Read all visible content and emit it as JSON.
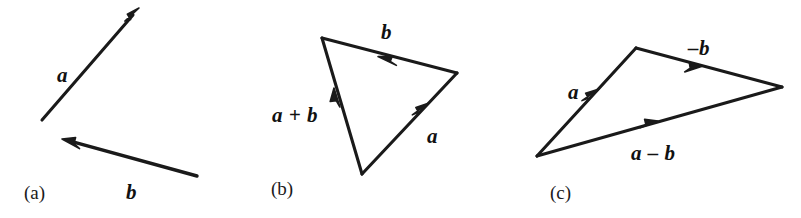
{
  "figure": {
    "background_color": "#ffffff",
    "stroke_color": "#1a1a1a",
    "panels": [
      {
        "caption": "(a)",
        "description": "Two free vectors a and b drawn separately",
        "labels": [
          {
            "text": "a",
            "x": 57,
            "y": 65
          },
          {
            "text": "b",
            "x": 126,
            "y": 182
          }
        ],
        "vectors": [
          {
            "name": "a",
            "from": [
              42,
              120
            ],
            "to": [
              139,
              8
            ]
          },
          {
            "name": "b",
            "from": [
              197,
              176
            ],
            "to": [
              62,
              139
            ]
          }
        ]
      },
      {
        "caption": "(b)",
        "description": "Triangle rule: a + b is the closing side",
        "labels": [
          {
            "text": "b",
            "x": 381,
            "y": 22
          },
          {
            "text": "a",
            "x": 427,
            "y": 126
          },
          {
            "text": "a + b",
            "x": 272,
            "y": 105
          }
        ],
        "vectors": [
          {
            "name": "a",
            "from": [
              362,
              174
            ],
            "to": [
              457,
              73
            ]
          },
          {
            "name": "b",
            "from": [
              457,
              73
            ],
            "to": [
              322,
              38
            ]
          },
          {
            "name": "a + b",
            "from": [
              362,
              174
            ],
            "to": [
              322,
              38
            ]
          }
        ]
      },
      {
        "caption": "(c)",
        "description": "Triangle rule: a - b drawn as a plus (-b)",
        "labels": [
          {
            "text": "a",
            "x": 568,
            "y": 82
          },
          {
            "text": "–b",
            "x": 688,
            "y": 38
          },
          {
            "text": "a – b",
            "x": 631,
            "y": 143
          }
        ],
        "vectors": [
          {
            "name": "a",
            "from": [
              537,
              156
            ],
            "to": [
              636,
              48
            ]
          },
          {
            "name": "-b",
            "from": [
              636,
              48
            ],
            "to": [
              782,
              87
            ]
          },
          {
            "name": "a - b",
            "from": [
              537,
              156
            ],
            "to": [
              782,
              87
            ]
          }
        ]
      }
    ],
    "captions": [
      {
        "text": "(a)",
        "x": 24,
        "y": 183
      },
      {
        "text": "(b)",
        "x": 271,
        "y": 179
      },
      {
        "text": "(c)",
        "x": 550,
        "y": 183
      }
    ]
  }
}
